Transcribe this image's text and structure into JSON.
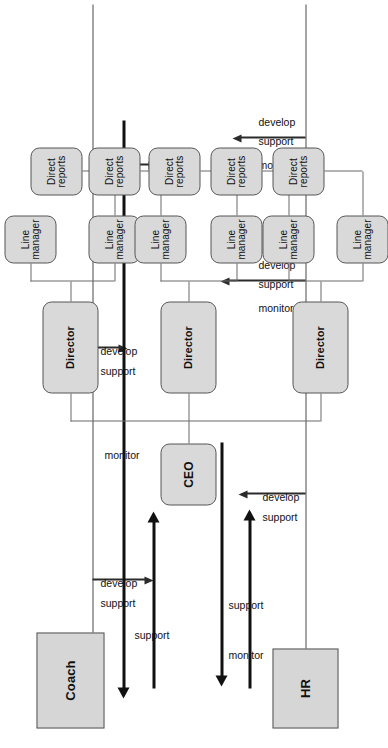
{
  "diagram": {
    "orientation": "rotated-90",
    "colors": {
      "node_fill": "#d9d9d9",
      "node_border": "#555555",
      "thick_arrow": "#111111",
      "thin_line": "#6b6b6b",
      "background": "#ffffff"
    },
    "nodes": {
      "coach": "Coach",
      "hr": "HR",
      "ceo": "CEO",
      "director_1": "Director",
      "director_2": "Director",
      "director_3": "Director",
      "line_manager_1": "Line\nmanager",
      "line_manager_2": "Line\nmanager",
      "line_manager_3": "Line\nmanager",
      "line_manager_4": "Line\nmanager",
      "line_manager_5": "Line\nmanager",
      "line_manager_6": "Line\nmanager",
      "direct_reports_1": "Direct\nreports",
      "direct_reports_2": "Direct\nreports",
      "direct_reports_3": "Direct\nreports",
      "direct_reports_4": "Direct\nreports",
      "direct_reports_5": "Direct\nreports"
    },
    "edge_labels": {
      "monitor": "monitor",
      "support": "support",
      "develop": "develop",
      "coach_to_ceo": "support",
      "hr_to_ceo": "support",
      "ceo_to_hr": "monitor",
      "hr_to_coach": "monitor",
      "coach_branch_1_line_1": "support",
      "coach_branch_1_line_2": "develop",
      "coach_branch_2_line_1": "support",
      "coach_branch_2_line_2": "develop",
      "coach_branch_3_line_1": "support",
      "coach_branch_3_line_2": "develop",
      "hr_branch_1_line_1": "support",
      "hr_branch_1_line_2": "develop",
      "hr_branch_2_line_1": "monitor",
      "hr_branch_2_line_2": "support",
      "hr_branch_2_line_3": "develop",
      "hr_branch_3_line_1": "monitor",
      "hr_branch_3_line_2": "support",
      "hr_branch_3_line_3": "develop"
    }
  }
}
